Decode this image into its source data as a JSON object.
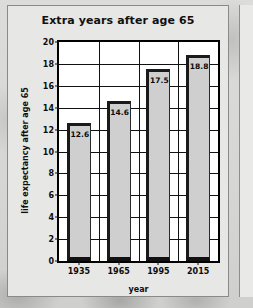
{
  "chart_data": {
    "type": "bar",
    "title": "Extra years after age 65",
    "xlabel": "year",
    "ylabel": "life expectancy after age 65",
    "categories": [
      "1935",
      "1965",
      "1995",
      "2015"
    ],
    "values": [
      12.6,
      14.6,
      17.5,
      18.8
    ],
    "value_labels": [
      "12.6",
      "14.6",
      "17.5",
      "18.8"
    ],
    "ylim": [
      0,
      20
    ],
    "ytick_labels": [
      "20",
      "18",
      "16",
      "14",
      "12",
      "10",
      "8",
      "6",
      "4",
      "2",
      "0"
    ],
    "ytick_values": [
      20,
      18,
      16,
      14,
      12,
      10,
      8,
      6,
      4,
      2,
      0
    ],
    "grid": "horizontal and vertical gridlines",
    "legend": "none",
    "colors": {
      "bar_face": "#cfcfcf",
      "bar_edge": "#1a1a1a",
      "plot_background": "#ffffff",
      "card_background": "#e7e7e5",
      "page_background": "#d9d9d7",
      "text": "#101010"
    }
  }
}
